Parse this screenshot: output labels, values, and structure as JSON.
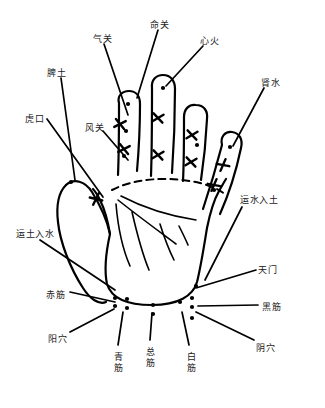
{
  "figure": {
    "type": "anatomical-hand-diagram",
    "background_color": "#ffffff",
    "ink_color": "#000000",
    "width": 325,
    "height": 408
  },
  "labels": [
    {
      "id": "qiguan",
      "text": "气关",
      "x": 93,
      "y": 34,
      "orientation": "horizontal"
    },
    {
      "id": "mingguan",
      "text": "命关",
      "x": 150,
      "y": 20,
      "orientation": "horizontal"
    },
    {
      "id": "xinhuo",
      "text": "心火",
      "x": 200,
      "y": 36,
      "orientation": "horizontal"
    },
    {
      "id": "shenshui",
      "text": "肾水",
      "x": 261,
      "y": 78,
      "orientation": "horizontal"
    },
    {
      "id": "pitu",
      "text": "脾土",
      "x": 47,
      "y": 68,
      "orientation": "horizontal"
    },
    {
      "id": "hukou",
      "text": "虎口",
      "x": 25,
      "y": 114,
      "orientation": "horizontal"
    },
    {
      "id": "fengguan",
      "text": "风关",
      "x": 85,
      "y": 123,
      "orientation": "horizontal"
    },
    {
      "id": "yunshuirutu",
      "text": "运水入土",
      "x": 240,
      "y": 195,
      "orientation": "horizontal"
    },
    {
      "id": "yunturushui",
      "text": "运土入水",
      "x": 16,
      "y": 229,
      "orientation": "horizontal"
    },
    {
      "id": "tianmen",
      "text": "天门",
      "x": 258,
      "y": 265,
      "orientation": "horizontal"
    },
    {
      "id": "chijin",
      "text": "赤筋",
      "x": 46,
      "y": 290,
      "orientation": "horizontal"
    },
    {
      "id": "heijin",
      "text": "黑筋",
      "x": 262,
      "y": 302,
      "orientation": "horizontal"
    },
    {
      "id": "yangxue",
      "text": "阳穴",
      "x": 48,
      "y": 334,
      "orientation": "horizontal"
    },
    {
      "id": "yinxue",
      "text": "阴穴",
      "x": 256,
      "y": 343,
      "orientation": "horizontal"
    },
    {
      "id": "qingjin",
      "text": "青筋",
      "x": 113,
      "y": 352,
      "orientation": "vertical"
    },
    {
      "id": "zongjin",
      "text": "总筋",
      "x": 145,
      "y": 347,
      "orientation": "vertical"
    },
    {
      "id": "baijin",
      "text": "白筋",
      "x": 186,
      "y": 352,
      "orientation": "vertical"
    }
  ],
  "leader_lines": [
    {
      "id": "leader-qiguan",
      "d": "M 104 44 L 128 115"
    },
    {
      "id": "leader-mingguan",
      "d": "M 158 30 L 137 98"
    },
    {
      "id": "leader-xinhuo",
      "d": "M 203 46 L 166 86"
    },
    {
      "id": "leader-shenshui",
      "d": "M 264 88 L 233 146"
    },
    {
      "id": "leader-pitu",
      "d": "M 61 78 L 75 180"
    },
    {
      "id": "leader-hukou",
      "d": "M 47 119 L 103 197"
    },
    {
      "id": "leader-fengguan",
      "d": "M 103 131 L 128 160"
    },
    {
      "id": "leader-yunshuirutu",
      "d": "M 242 207 L 205 280"
    },
    {
      "id": "leader-yunturushui",
      "d": "M 40 240 L 115 290"
    },
    {
      "id": "leader-tianmen",
      "d": "M 256 270 L 196 288"
    },
    {
      "id": "leader-chijin",
      "d": "M 70 292 L 115 302"
    },
    {
      "id": "leader-heijin",
      "d": "M 258 305 L 198 306"
    },
    {
      "id": "leader-yangxue",
      "d": "M 70 332 L 114 309"
    },
    {
      "id": "leader-yinxue",
      "d": "M 254 340 L 196 312"
    },
    {
      "id": "leader-qingjin",
      "d": "M 118 345 L 123 312"
    },
    {
      "id": "leader-zongjin",
      "d": "M 150 340 L 152 313"
    },
    {
      "id": "leader-baijin",
      "d": "M 189 345 L 182 312"
    }
  ],
  "acupoint_dots": [
    {
      "id": "dot-thumb-tip",
      "x": 71,
      "y": 182
    },
    {
      "id": "dot-index-tip",
      "x": 128,
      "y": 104
    },
    {
      "id": "dot-index-mid",
      "x": 126,
      "y": 131
    },
    {
      "id": "dot-index-low",
      "x": 124,
      "y": 156
    },
    {
      "id": "dot-middle-tip",
      "x": 163,
      "y": 88
    },
    {
      "id": "dot-ring-mid",
      "x": 197,
      "y": 145
    },
    {
      "id": "dot-pinky-tip",
      "x": 230,
      "y": 147
    },
    {
      "id": "dot-palm-right",
      "x": 214,
      "y": 190
    },
    {
      "id": "dot-wrist-a",
      "x": 115,
      "y": 298
    },
    {
      "id": "dot-wrist-b",
      "x": 115,
      "y": 306
    },
    {
      "id": "dot-wrist-c",
      "x": 127,
      "y": 299
    },
    {
      "id": "dot-wrist-d",
      "x": 127,
      "y": 308
    },
    {
      "id": "dot-wrist-e",
      "x": 153,
      "y": 305
    },
    {
      "id": "dot-wrist-f",
      "x": 153,
      "y": 314
    },
    {
      "id": "dot-wrist-g",
      "x": 180,
      "y": 302
    },
    {
      "id": "dot-wrist-h",
      "x": 192,
      "y": 298
    },
    {
      "id": "dot-wrist-i",
      "x": 192,
      "y": 307
    },
    {
      "id": "dot-wrist-j",
      "x": 192,
      "y": 318
    },
    {
      "id": "dot-wrist-k",
      "x": 196,
      "y": 286
    }
  ],
  "crossmarks": [
    {
      "id": "x-thumb",
      "x": 96,
      "y": 199,
      "r": -25
    },
    {
      "id": "x-index-1",
      "x": 120,
      "y": 124,
      "r": 12
    },
    {
      "id": "x-index-2",
      "x": 124,
      "y": 149,
      "r": 12
    },
    {
      "id": "x-middle-1",
      "x": 158,
      "y": 118,
      "r": 8
    },
    {
      "id": "x-middle-2",
      "x": 158,
      "y": 155,
      "r": 8
    },
    {
      "id": "x-ring-1",
      "x": 192,
      "y": 135,
      "r": 8
    },
    {
      "id": "x-ring-2",
      "x": 191,
      "y": 162,
      "r": 8
    },
    {
      "id": "x-pinky-1",
      "x": 223,
      "y": 165,
      "r": -28
    },
    {
      "id": "x-pinky-2",
      "x": 214,
      "y": 185,
      "r": -28
    }
  ]
}
